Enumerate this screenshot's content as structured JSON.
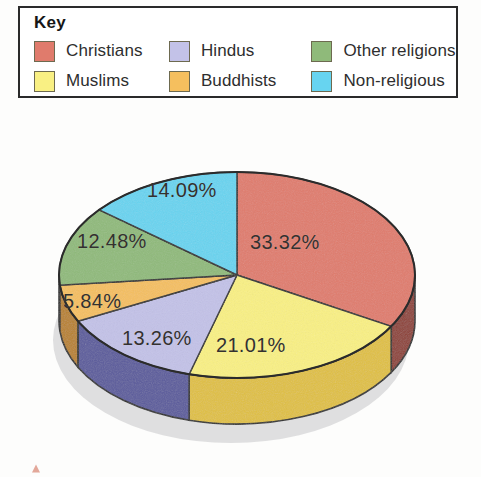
{
  "legend": {
    "title": "Key",
    "items": [
      {
        "label": "Christians",
        "color": "#e07b6c",
        "side_color": "#8e4036",
        "icon": "legend-swatch-icon"
      },
      {
        "label": "Hindus",
        "color": "#c3c2e8",
        "side_color": "#5a5a9c",
        "icon": "legend-swatch-icon"
      },
      {
        "label": "Other religions",
        "color": "#8fba7a",
        "side_color": "#4e7a44",
        "icon": "legend-swatch-icon"
      },
      {
        "label": "Muslims",
        "color": "#f9f083",
        "side_color": "#e3c githubusercontent",
        "icon": "legend-swatch-icon"
      },
      {
        "label": "Buddhists",
        "color": "#f5bf5e",
        "side_color": "#b8822b",
        "icon": "legend-swatch-icon"
      },
      {
        "label": "Non-religious",
        "color": "#67d4f0",
        "side_color": "#2f94b5",
        "icon": "legend-swatch-icon"
      }
    ]
  },
  "chart_data": {
    "type": "pie",
    "title": "",
    "legend_position": "top",
    "start_angle_deg": 0,
    "direction": "clockwise",
    "three_d": true,
    "categories": [
      "Christians",
      "Muslims",
      "Hindus",
      "Buddhists",
      "Other religions",
      "Non-religious"
    ],
    "values": [
      33.32,
      21.01,
      13.26,
      5.84,
      12.48,
      14.09
    ],
    "labels": [
      "33.32%",
      "21.01%",
      "13.26%",
      "5.84%",
      "12.48%",
      "14.09%"
    ],
    "colors": [
      "#e07b6c",
      "#f9f083",
      "#c3c2e8",
      "#f5bf5e",
      "#8fba7a",
      "#67d4f0"
    ],
    "side_colors": [
      "#8e4036",
      "#e0c040",
      "#5a5a9c",
      "#b8822b",
      "#4e7a44",
      "#2f94b5"
    ],
    "units": "percent",
    "total": 100.0
  },
  "slice_labels": {
    "christians": "33.32%",
    "muslims": "21.01%",
    "hindus": "13.26%",
    "buddhists": "5.84%",
    "other_religions": "12.48%",
    "non_religious": "14.09%"
  }
}
